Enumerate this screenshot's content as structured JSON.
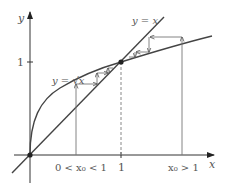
{
  "axes": {
    "x_label": "x",
    "y_label": "y",
    "x_tick": "1",
    "y_tick": "1"
  },
  "curves": {
    "line_label": "y = x",
    "sqrt_label": "y = √x"
  },
  "start_points": {
    "left_label": "0 < x₀ < 1",
    "right_label": "x₀ > 1"
  },
  "colors": {
    "curve": "#444444",
    "axis": "#333333",
    "guide": "#777777"
  }
}
